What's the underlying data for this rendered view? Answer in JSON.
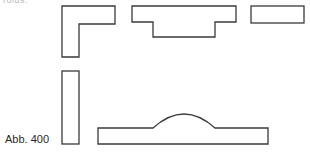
{
  "figure": {
    "caption": "Abb. 400",
    "cropped_top_text": "rolds:",
    "stroke_color": "#3a3a3a",
    "background": "#ffffff",
    "shapes": [
      {
        "name": "l-shaped-piece",
        "type": "polygon"
      },
      {
        "name": "stepped-t-piece",
        "type": "polygon"
      },
      {
        "name": "flat-rectangle-piece",
        "type": "rectangle"
      },
      {
        "name": "vertical-rectangle-piece",
        "type": "rectangle"
      },
      {
        "name": "plate-with-arc-piece",
        "type": "path"
      }
    ]
  }
}
